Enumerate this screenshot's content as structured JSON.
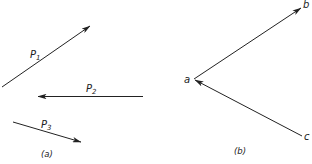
{
  "figure": {
    "panel_a": {
      "caption": "(a)",
      "vectors": [
        {
          "name": "P",
          "subscript": "1",
          "from": [
            2,
            87
          ],
          "to": [
            90,
            26
          ],
          "arrow_at": "end"
        },
        {
          "name": "P",
          "subscript": "2",
          "from": [
            143,
            96
          ],
          "to": [
            38,
            96
          ],
          "arrow_at": "end"
        },
        {
          "name": "P",
          "subscript": "3",
          "from": [
            13,
            122
          ],
          "to": [
            81,
            142
          ],
          "arrow_at": "end"
        }
      ]
    },
    "panel_b": {
      "caption": "(b)",
      "points": {
        "a": {
          "label": "a",
          "pos": [
            194,
            79
          ]
        },
        "b": {
          "label": "b",
          "pos": [
            301,
            8
          ]
        },
        "c": {
          "label": "c",
          "pos": [
            302,
            136
          ]
        }
      },
      "vectors": [
        {
          "from": "a",
          "to": "b"
        },
        {
          "from": "c",
          "to": "a"
        }
      ]
    },
    "colors": {
      "stroke": "#222222",
      "background": "#ffffff"
    }
  }
}
